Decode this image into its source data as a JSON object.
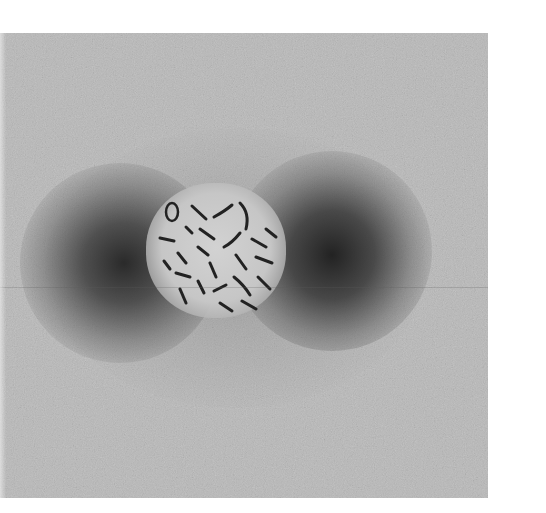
{
  "image": {
    "description": "Grayscale micrograph of a metaphase chromosome spread with two dark diffuse halos on either side",
    "colors": {
      "background": "#b9b9b9",
      "dark_halo": "#2a2a2a",
      "chromosome": "#1e1e1e",
      "center_spread": "#d0d0d0",
      "page": "#ffffff"
    }
  }
}
